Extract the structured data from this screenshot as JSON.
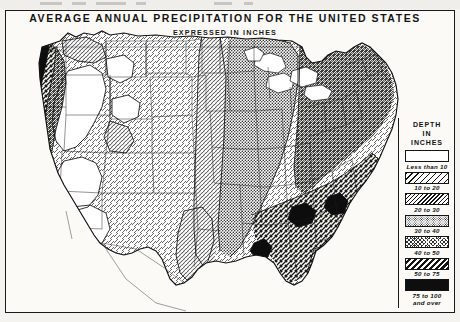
{
  "document": {
    "title": "AVERAGE ANNUAL PRECIPITATION FOR THE UNITED STATES",
    "subtitle": "EXPRESSED IN INCHES"
  },
  "legend": {
    "heading_line1": "DEPTH",
    "heading_line2": "IN",
    "heading_line3": "INCHES",
    "items": [
      {
        "label": "Less than 10",
        "pattern": "blank",
        "fill": "#ffffff"
      },
      {
        "label": "10 to 20",
        "pattern": "diagonal-light",
        "fill": "#e8e7e2"
      },
      {
        "label": "20 to 30",
        "pattern": "diagonal-medium",
        "fill": "#cfcdc6"
      },
      {
        "label": "30 to 40",
        "pattern": "stipple-dense",
        "fill": "#9a9891"
      },
      {
        "label": "40 to 50",
        "pattern": "crosshatch",
        "fill": "#6f6d67"
      },
      {
        "label": "50 to 75",
        "pattern": "diagonal-bold",
        "fill": "#3a3a36"
      },
      {
        "label": "75 to 100 and over",
        "label_line1": "75 to 100",
        "label_line2": "and over",
        "pattern": "solid-black",
        "fill": "#121212"
      }
    ]
  },
  "map": {
    "region_name": "United States",
    "colors": {
      "ink": "#141414",
      "paper": "#fbfaf7",
      "water": "#ffffff"
    },
    "zones": [
      {
        "name": "pacific-northwest-coast",
        "class": "75 to 100 and over"
      },
      {
        "name": "cascade-range",
        "class": "50 to 75"
      },
      {
        "name": "sierra-nevada",
        "class": "40 to 50"
      },
      {
        "name": "great-basin",
        "class": "Less than 10"
      },
      {
        "name": "southwest-desert",
        "class": "Less than 10"
      },
      {
        "name": "northern-rockies",
        "class": "20 to 30"
      },
      {
        "name": "high-plains",
        "class": "10 to 20"
      },
      {
        "name": "central-plains",
        "class": "20 to 30"
      },
      {
        "name": "midwest",
        "class": "30 to 40"
      },
      {
        "name": "great-lakes-region",
        "class": "30 to 40"
      },
      {
        "name": "northeast",
        "class": "40 to 50"
      },
      {
        "name": "appalachians",
        "class": "40 to 50"
      },
      {
        "name": "gulf-coast",
        "class": "50 to 75"
      },
      {
        "name": "southeast",
        "class": "50 to 75"
      },
      {
        "name": "florida",
        "class": "50 to 75"
      },
      {
        "name": "south-texas",
        "class": "20 to 30"
      },
      {
        "name": "west-texas",
        "class": "10 to 20"
      }
    ]
  }
}
